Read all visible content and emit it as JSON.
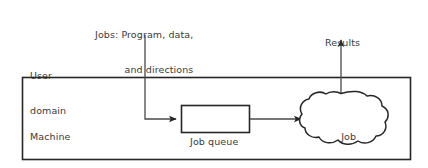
{
  "diagram": {
    "stroke_color": "#262626",
    "text_color": "#3a3a3a",
    "background_color": "#ffffff",
    "labels": {
      "jobs_input": {
        "name": "jobs-input-label",
        "line1": "Jobs: Program, data,",
        "line2": "and directions"
      },
      "results_output": {
        "name": "results-output-label",
        "line1": "Results"
      },
      "user_domain": {
        "name": "user-domain-label",
        "line1": "User",
        "line2": "domain"
      },
      "machine_domain": {
        "name": "machine-domain-label",
        "line1": "Machine",
        "line2": "domain"
      },
      "job_queue": {
        "name": "job-queue-label",
        "line1": "Job queue"
      },
      "job_execution": {
        "name": "job-execution-label",
        "line1": "Job",
        "line2": "execution"
      }
    },
    "nodes": [
      {
        "id": "machine-domain-box",
        "shape": "rectangle",
        "label": "Machine domain"
      },
      {
        "id": "job-queue-box",
        "shape": "rectangle",
        "label": "Job queue"
      },
      {
        "id": "job-execution-cloud",
        "shape": "cloud",
        "label": "Job execution"
      }
    ],
    "connectors": [
      {
        "id": "jobs-to-queue",
        "from": "Jobs: Program, data, and directions",
        "to": "Job queue",
        "arrowhead": "end"
      },
      {
        "id": "queue-to-execution",
        "from": "Job queue",
        "to": "Job execution",
        "arrowhead": "end"
      },
      {
        "id": "execution-to-results",
        "from": "Job execution",
        "to": "Results",
        "arrowhead": "end"
      }
    ]
  }
}
